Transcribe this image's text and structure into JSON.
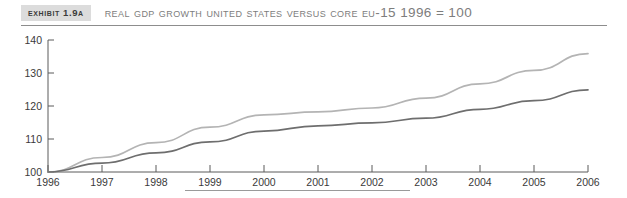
{
  "header": {
    "badge_label": "Exhibit 1.9A",
    "title": "Real GDP Growth United States versus Core EU-15 1996 = 100"
  },
  "chart_data": {
    "type": "line",
    "title": "Real GDP Growth United States versus Core EU-15 1996 = 100",
    "xlabel": "",
    "ylabel": "",
    "xlim": [
      1996,
      2006
    ],
    "ylim": [
      100,
      140
    ],
    "grid": false,
    "legend_position": "none",
    "x": [
      1996,
      1997,
      1998,
      1999,
      2000,
      2001,
      2002,
      2003,
      2004,
      2005,
      2006
    ],
    "xtick_labels": [
      "1996",
      "1997",
      "1998",
      "1999",
      "2000",
      "2001",
      "2002",
      "2003",
      "2004",
      "2005",
      "2006"
    ],
    "ytick_labels": [
      "100",
      "110",
      "120",
      "130",
      "140"
    ],
    "yticks": [
      100,
      110,
      120,
      130,
      140
    ],
    "series": [
      {
        "name": "United States",
        "color": "#b4b4b4",
        "values": [
          100.0,
          104.4,
          108.9,
          113.6,
          117.3,
          118.2,
          119.4,
          122.4,
          126.7,
          130.8,
          135.9
        ]
      },
      {
        "name": "Core EU-15",
        "color": "#6e6e6e",
        "values": [
          100.0,
          102.7,
          105.8,
          109.1,
          112.4,
          114.0,
          114.9,
          116.3,
          119.0,
          121.6,
          124.9
        ]
      }
    ]
  }
}
